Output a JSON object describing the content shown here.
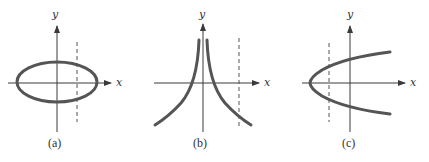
{
  "figure": {
    "panels": [
      {
        "id": "a",
        "caption": "(a)",
        "x_axis_label": "x",
        "y_axis_label": "y",
        "curve": "ellipse",
        "has_vertical_dashed_line": true
      },
      {
        "id": "b",
        "caption": "(b)",
        "x_axis_label": "x",
        "y_axis_label": "y",
        "curve": "symmetric-cusp-decay",
        "has_vertical_dashed_line": true
      },
      {
        "id": "c",
        "caption": "(c)",
        "x_axis_label": "x",
        "y_axis_label": "y",
        "curve": "sideways-parabola",
        "has_vertical_dashed_line": true
      }
    ],
    "colors": {
      "curve": "#555555",
      "axis": "#3a3a3a",
      "background": "#ffffff"
    }
  }
}
